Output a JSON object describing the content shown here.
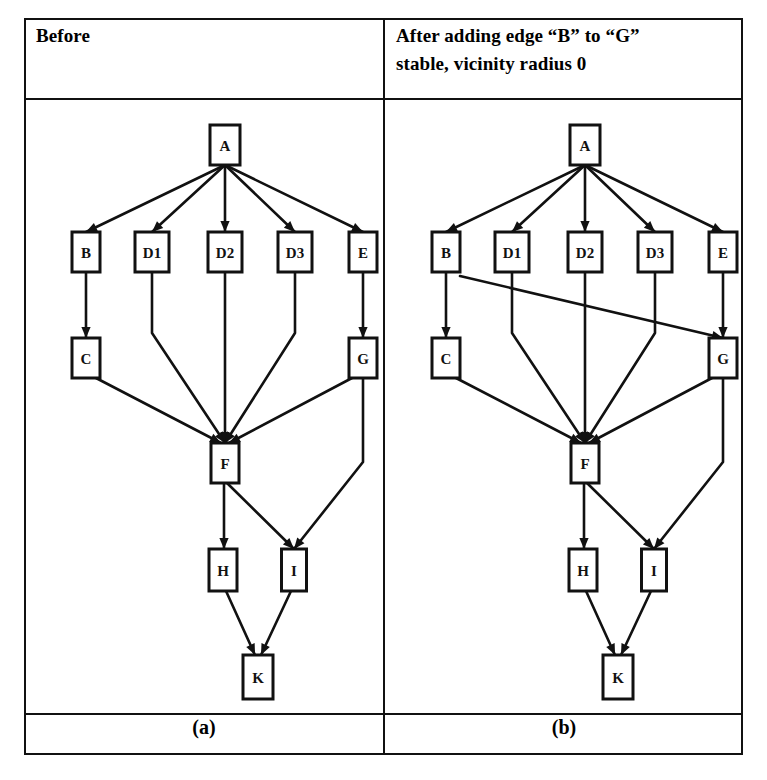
{
  "figure": {
    "width": 767,
    "height": 780,
    "background_color": "#ffffff",
    "line_color": "#111111"
  },
  "headers": {
    "left": "Before",
    "right": "After adding edge “B” to “G”\nstable, vicinity radius 0"
  },
  "captions": {
    "left": "(a)",
    "right": "(b)"
  },
  "chart_data": {
    "type": "diagram",
    "subtype": "directed-acyclic-graph",
    "panels": [
      {
        "id": "a",
        "header": "Before",
        "caption": "(a)",
        "node_labels": [
          "A",
          "B",
          "D1",
          "D2",
          "D3",
          "E",
          "C",
          "G",
          "F",
          "H",
          "I",
          "K"
        ],
        "nodes": [
          {
            "id": "A",
            "label": "A",
            "x": 200,
            "y": 45,
            "w": 30,
            "h": 40
          },
          {
            "id": "B",
            "label": "B",
            "x": 61,
            "y": 152,
            "w": 28,
            "h": 40
          },
          {
            "id": "D1",
            "label": "D1",
            "x": 127,
            "y": 152,
            "w": 34,
            "h": 40
          },
          {
            "id": "D2",
            "label": "D2",
            "x": 200,
            "y": 152,
            "w": 34,
            "h": 40
          },
          {
            "id": "D3",
            "label": "D3",
            "x": 270,
            "y": 152,
            "w": 34,
            "h": 40
          },
          {
            "id": "E",
            "label": "E",
            "x": 338,
            "y": 152,
            "w": 28,
            "h": 40
          },
          {
            "id": "C",
            "label": "C",
            "x": 61,
            "y": 258,
            "w": 28,
            "h": 40
          },
          {
            "id": "G",
            "label": "G",
            "x": 338,
            "y": 258,
            "w": 28,
            "h": 40
          },
          {
            "id": "F",
            "label": "F",
            "x": 200,
            "y": 363,
            "w": 28,
            "h": 40
          },
          {
            "id": "H",
            "label": "H",
            "x": 198,
            "y": 470,
            "w": 28,
            "h": 42
          },
          {
            "id": "I",
            "label": "I",
            "x": 269,
            "y": 470,
            "w": 25,
            "h": 42
          },
          {
            "id": "K",
            "label": "K",
            "x": 233,
            "y": 577,
            "w": 30,
            "h": 44
          }
        ],
        "edges": [
          {
            "from": "A",
            "to": "B"
          },
          {
            "from": "A",
            "to": "D1"
          },
          {
            "from": "A",
            "to": "D2"
          },
          {
            "from": "A",
            "to": "D3"
          },
          {
            "from": "A",
            "to": "E"
          },
          {
            "from": "B",
            "to": "C"
          },
          {
            "from": "E",
            "to": "G"
          },
          {
            "from": "C",
            "to": "F"
          },
          {
            "from": "D1",
            "to": "F"
          },
          {
            "from": "D2",
            "to": "F"
          },
          {
            "from": "D3",
            "to": "F"
          },
          {
            "from": "G",
            "to": "F"
          },
          {
            "from": "F",
            "to": "H"
          },
          {
            "from": "F",
            "to": "I"
          },
          {
            "from": "G",
            "to": "I"
          },
          {
            "from": "H",
            "to": "K"
          },
          {
            "from": "I",
            "to": "K"
          }
        ],
        "edge_count": 17,
        "node_count": 12
      },
      {
        "id": "b",
        "header": "After adding edge “B” to “G” stable, vicinity radius 0",
        "caption": "(b)",
        "node_labels": [
          "A",
          "B",
          "D1",
          "D2",
          "D3",
          "E",
          "C",
          "G",
          "F",
          "H",
          "I",
          "K"
        ],
        "nodes": [
          {
            "id": "A",
            "label": "A",
            "x": 200,
            "y": 45,
            "w": 30,
            "h": 40
          },
          {
            "id": "B",
            "label": "B",
            "x": 61,
            "y": 152,
            "w": 28,
            "h": 40
          },
          {
            "id": "D1",
            "label": "D1",
            "x": 127,
            "y": 152,
            "w": 34,
            "h": 40
          },
          {
            "id": "D2",
            "label": "D2",
            "x": 200,
            "y": 152,
            "w": 34,
            "h": 40
          },
          {
            "id": "D3",
            "label": "D3",
            "x": 270,
            "y": 152,
            "w": 34,
            "h": 40
          },
          {
            "id": "E",
            "label": "E",
            "x": 338,
            "y": 152,
            "w": 28,
            "h": 40
          },
          {
            "id": "C",
            "label": "C",
            "x": 61,
            "y": 258,
            "w": 28,
            "h": 40
          },
          {
            "id": "G",
            "label": "G",
            "x": 338,
            "y": 258,
            "w": 28,
            "h": 40
          },
          {
            "id": "F",
            "label": "F",
            "x": 200,
            "y": 363,
            "w": 28,
            "h": 40
          },
          {
            "id": "H",
            "label": "H",
            "x": 198,
            "y": 470,
            "w": 28,
            "h": 42
          },
          {
            "id": "I",
            "label": "I",
            "x": 269,
            "y": 470,
            "w": 25,
            "h": 42
          },
          {
            "id": "K",
            "label": "K",
            "x": 233,
            "y": 577,
            "w": 30,
            "h": 44
          }
        ],
        "edges": [
          {
            "from": "A",
            "to": "B"
          },
          {
            "from": "A",
            "to": "D1"
          },
          {
            "from": "A",
            "to": "D2"
          },
          {
            "from": "A",
            "to": "D3"
          },
          {
            "from": "A",
            "to": "E"
          },
          {
            "from": "B",
            "to": "C"
          },
          {
            "from": "B",
            "to": "G",
            "added": true
          },
          {
            "from": "E",
            "to": "G"
          },
          {
            "from": "C",
            "to": "F"
          },
          {
            "from": "D1",
            "to": "F"
          },
          {
            "from": "D2",
            "to": "F"
          },
          {
            "from": "D3",
            "to": "F"
          },
          {
            "from": "G",
            "to": "F"
          },
          {
            "from": "F",
            "to": "H"
          },
          {
            "from": "F",
            "to": "I"
          },
          {
            "from": "G",
            "to": "I"
          },
          {
            "from": "H",
            "to": "K"
          },
          {
            "from": "I",
            "to": "K"
          }
        ],
        "added_edge": {
          "from": "B",
          "to": "G"
        },
        "edge_count": 18,
        "node_count": 12
      }
    ]
  }
}
